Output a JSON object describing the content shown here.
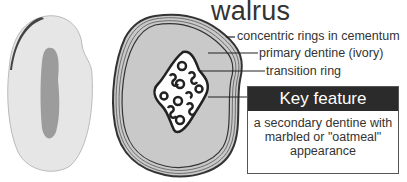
{
  "title": "walrus",
  "labels": {
    "cementum": "concentric rings in cementum",
    "primary": "primary dentine (ivory)",
    "transition": "transition ring"
  },
  "key": {
    "heading": "Key feature",
    "line1": "a secondary dentine with",
    "line2": "marbled or \"oatmeal\"",
    "line3": "appearance"
  },
  "colors": {
    "ivory_fill": "#c9c9c9",
    "outline": "#333333",
    "key_header": "#2b2b2b"
  }
}
